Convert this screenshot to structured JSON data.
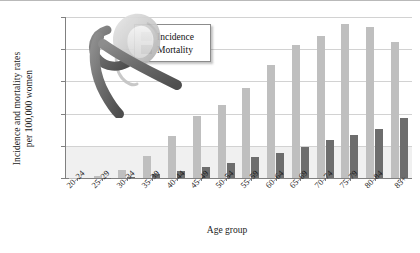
{
  "chart_data": {
    "type": "bar",
    "title": "",
    "xlabel": "Age group",
    "ylabel": "Incidence and mortality rates\nper 100,000 women",
    "ylim": [
      0,
      500
    ],
    "yticks": [
      0,
      100,
      200,
      300,
      400,
      500
    ],
    "grid": true,
    "legend_position": "top-left-inside",
    "categories": [
      "20–24",
      "25–29",
      "30–34",
      "35–39",
      "40–44",
      "45–49",
      "50–54",
      "55–59",
      "60–64",
      "65–69",
      "70–74",
      "75–79",
      "80–84",
      "85+"
    ],
    "series": [
      {
        "name": "Incidence",
        "color": "#bfbfbf",
        "values": [
          1,
          7,
          25,
          67,
          130,
          192,
          227,
          280,
          352,
          412,
          440,
          478,
          470,
          423
        ]
      },
      {
        "name": "Mortality",
        "color": "#6d6d6d",
        "values": [
          0,
          1,
          4,
          13,
          21,
          33,
          48,
          64,
          78,
          96,
          118,
          135,
          152,
          185
        ]
      }
    ]
  },
  "axes": {
    "y_title_line1": "Incidence and mortality rates",
    "y_title_line2": "per 100,000 women",
    "x_title": "Age group"
  },
  "legend": {
    "items": [
      {
        "label": "Incidence",
        "color": "#bfbfbf"
      },
      {
        "label": "Mortality",
        "color": "#6d6d6d"
      }
    ]
  },
  "decor": {
    "graphic_name": "awareness-ribbon-and-woman-silhouette"
  }
}
